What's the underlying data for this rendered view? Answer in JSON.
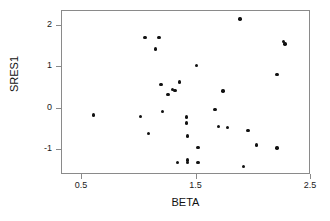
{
  "chart_data": {
    "type": "scatter",
    "title": "",
    "xlabel": "BETA",
    "ylabel": "SRES1",
    "xlim": [
      0.325,
      2.5
    ],
    "ylim": [
      -1.6,
      2.35
    ],
    "grid": false,
    "legend": null,
    "xticks": [
      0.5,
      1.5,
      2.5
    ],
    "xticklabels": [
      "0.5",
      "1.5",
      "2.5"
    ],
    "yticks": [
      -1,
      0,
      1,
      2
    ],
    "yticklabels": [
      "-1",
      "0",
      "1",
      "2"
    ],
    "marker": "filled-circle",
    "marker_color": "#111111",
    "points": [
      {
        "x": 0.61,
        "y": -0.18
      },
      {
        "x": 1.06,
        "y": 1.69
      },
      {
        "x": 1.18,
        "y": 1.69
      },
      {
        "x": 1.15,
        "y": 1.41
      },
      {
        "x": 1.02,
        "y": -0.22
      },
      {
        "x": 1.09,
        "y": -0.63
      },
      {
        "x": 1.2,
        "y": 0.56
      },
      {
        "x": 1.21,
        "y": -0.09
      },
      {
        "x": 1.26,
        "y": 0.32
      },
      {
        "x": 1.3,
        "y": 0.44
      },
      {
        "x": 1.32,
        "y": 0.41
      },
      {
        "x": 1.36,
        "y": 0.62
      },
      {
        "x": 1.34,
        "y": -1.32
      },
      {
        "x": 1.42,
        "y": -0.23
      },
      {
        "x": 1.42,
        "y": -0.37
      },
      {
        "x": 1.43,
        "y": -0.68
      },
      {
        "x": 1.43,
        "y": -1.32
      },
      {
        "x": 1.43,
        "y": -1.26
      },
      {
        "x": 1.52,
        "y": -1.32
      },
      {
        "x": 1.51,
        "y": 1.02
      },
      {
        "x": 1.52,
        "y": -0.96
      },
      {
        "x": 1.67,
        "y": -0.04
      },
      {
        "x": 1.7,
        "y": -0.46
      },
      {
        "x": 1.78,
        "y": -0.48
      },
      {
        "x": 1.74,
        "y": 0.4
      },
      {
        "x": 1.89,
        "y": 2.13
      },
      {
        "x": 1.96,
        "y": -0.55
      },
      {
        "x": 1.92,
        "y": -1.42
      },
      {
        "x": 2.03,
        "y": -0.9
      },
      {
        "x": 2.21,
        "y": -0.97
      },
      {
        "x": 2.21,
        "y": 0.79
      },
      {
        "x": 2.27,
        "y": 1.59
      },
      {
        "x": 2.28,
        "y": 1.53
      }
    ]
  }
}
